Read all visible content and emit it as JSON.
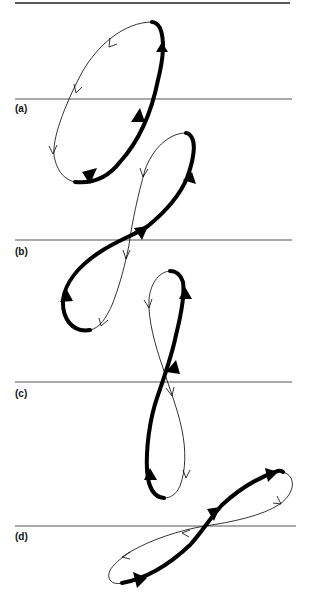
{
  "figure": {
    "panels": [
      {
        "id": "a",
        "label": "(a)",
        "description": "Tilted elliptical loop; thick segment on right side (upward, 3 arrowheads), thin segment on left side (downward, 3 arrowheads)"
      },
      {
        "id": "b",
        "label": "(b)",
        "description": "Figure-eight loop crossing the reference line; thick path with arrowheads, thin return path with arrowheads"
      },
      {
        "id": "c",
        "label": "(c)",
        "description": "Vertical figure-eight loop; thick left/right arcs going up, thin arcs going down"
      },
      {
        "id": "d",
        "label": "(d)",
        "description": "Horizontal tilted figure-eight; thick path rising to the right, thin path returning left"
      }
    ],
    "colors": {
      "stroke": "#000000",
      "reference_line": "#555555",
      "background": "#ffffff"
    }
  }
}
